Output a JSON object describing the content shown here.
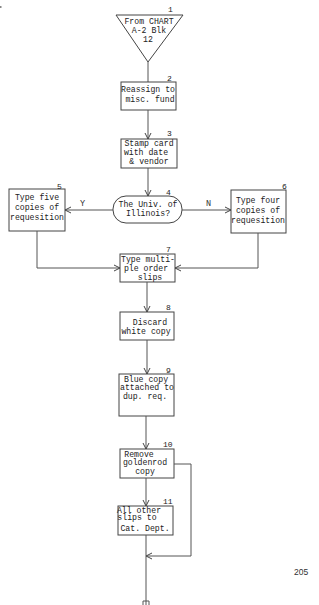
{
  "diagram": {
    "type": "flowchart",
    "page_number": "205",
    "nodes": [
      {
        "id": "1",
        "shape": "inverted-triangle",
        "lines": [
          "From CHART",
          "A-2 Blk",
          "12"
        ]
      },
      {
        "id": "2",
        "shape": "process",
        "lines": [
          "Reassign to",
          "misc. fund"
        ]
      },
      {
        "id": "3",
        "shape": "process",
        "lines": [
          "Stamp card",
          "with date",
          "& vendor"
        ]
      },
      {
        "id": "4",
        "shape": "terminal-decision",
        "lines": [
          "The Univ. of",
          "Illinois?"
        ]
      },
      {
        "id": "5",
        "shape": "process",
        "lines": [
          "Type five",
          "copies of",
          "requesition"
        ]
      },
      {
        "id": "6",
        "shape": "process",
        "lines": [
          "Type four",
          "copies of",
          "requesition"
        ]
      },
      {
        "id": "7",
        "shape": "process",
        "lines": [
          "Type multi-",
          "ple order",
          "slips"
        ]
      },
      {
        "id": "8",
        "shape": "process",
        "lines": [
          "Discard",
          "white copy"
        ]
      },
      {
        "id": "9",
        "shape": "process",
        "lines": [
          "Blue copy",
          "attached to",
          "dup. req."
        ]
      },
      {
        "id": "10",
        "shape": "process",
        "lines": [
          "Remove",
          "goldenrod",
          "copy"
        ]
      },
      {
        "id": "11",
        "shape": "process",
        "lines": [
          "All other",
          "slips to",
          "Cat. Dept."
        ]
      }
    ],
    "edges": [
      {
        "from": "1",
        "to": "2"
      },
      {
        "from": "2",
        "to": "3"
      },
      {
        "from": "3",
        "to": "4"
      },
      {
        "from": "4",
        "to": "5",
        "label": "Y"
      },
      {
        "from": "4",
        "to": "6",
        "label": "N"
      },
      {
        "from": "5",
        "to": "7"
      },
      {
        "from": "6",
        "to": "7"
      },
      {
        "from": "7",
        "to": "8"
      },
      {
        "from": "8",
        "to": "9"
      },
      {
        "from": "9",
        "to": "10"
      },
      {
        "from": "10",
        "to": "11"
      },
      {
        "from": "10",
        "to": "exit",
        "note": "bypass loop on right rejoining below 11"
      },
      {
        "from": "11",
        "to": "exit"
      }
    ],
    "labels": {
      "yes": "Y",
      "no": "N"
    },
    "exit_connector": "offpage-connector"
  }
}
